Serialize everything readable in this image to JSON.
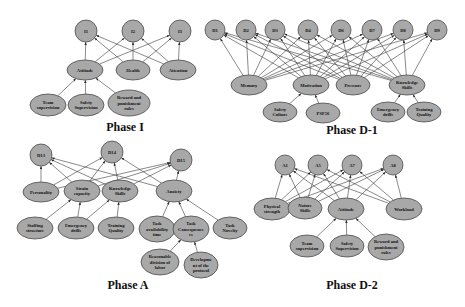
{
  "diagrams": [
    {
      "id": "phaseI",
      "title": "Phase I",
      "title_pos": [
        125,
        131
      ],
      "nodes": [
        {
          "id": "I1",
          "label": [
            "I1"
          ],
          "x": 86,
          "y": 31,
          "rx": 11,
          "ry": 11
        },
        {
          "id": "I2",
          "label": [
            "I2"
          ],
          "x": 133,
          "y": 31,
          "rx": 11,
          "ry": 11
        },
        {
          "id": "I3",
          "label": [
            "I3"
          ],
          "x": 180,
          "y": 31,
          "rx": 11,
          "ry": 11
        },
        {
          "id": "Attitude",
          "label": [
            "Attitude"
          ],
          "x": 85,
          "y": 70,
          "rx": 18,
          "ry": 10
        },
        {
          "id": "Health",
          "label": [
            "Health"
          ],
          "x": 133,
          "y": 70,
          "rx": 17,
          "ry": 10
        },
        {
          "id": "Attention",
          "label": [
            "Attention"
          ],
          "x": 178,
          "y": 70,
          "rx": 18,
          "ry": 10
        },
        {
          "id": "TeamSup",
          "label": [
            "Team",
            "supervision"
          ],
          "x": 48,
          "y": 105,
          "rx": 18,
          "ry": 11
        },
        {
          "id": "SafetySup",
          "label": [
            "Safety",
            "Supervision"
          ],
          "x": 86,
          "y": 105,
          "rx": 18,
          "ry": 11
        },
        {
          "id": "Reward",
          "label": [
            "Reward and",
            "punishment",
            "rules"
          ],
          "x": 129,
          "y": 103,
          "rx": 21,
          "ry": 13
        }
      ],
      "edges": [
        [
          "Attitude",
          "I1"
        ],
        [
          "Attitude",
          "I2"
        ],
        [
          "Attitude",
          "I3"
        ],
        [
          "Health",
          "I1"
        ],
        [
          "Health",
          "I2"
        ],
        [
          "Health",
          "I3"
        ],
        [
          "Attention",
          "I1"
        ],
        [
          "Attention",
          "I2"
        ],
        [
          "Attention",
          "I3"
        ],
        [
          "TeamSup",
          "Attitude"
        ],
        [
          "SafetySup",
          "Attitude"
        ],
        [
          "Reward",
          "Attitude"
        ]
      ]
    },
    {
      "id": "phaseD1",
      "title": "Phase D-1",
      "title_pos": [
        352,
        134
      ],
      "nodes": [
        {
          "id": "D1",
          "label": [
            "D1"
          ],
          "x": 215,
          "y": 30,
          "rx": 10,
          "ry": 10
        },
        {
          "id": "D2",
          "label": [
            "D2"
          ],
          "x": 246,
          "y": 30,
          "rx": 10,
          "ry": 10
        },
        {
          "id": "D3",
          "label": [
            "D3"
          ],
          "x": 275,
          "y": 30,
          "rx": 10,
          "ry": 10
        },
        {
          "id": "D4",
          "label": [
            "D4"
          ],
          "x": 308,
          "y": 30,
          "rx": 10,
          "ry": 10
        },
        {
          "id": "D6",
          "label": [
            "D6"
          ],
          "x": 341,
          "y": 30,
          "rx": 10,
          "ry": 10
        },
        {
          "id": "D7",
          "label": [
            "D7"
          ],
          "x": 372,
          "y": 30,
          "rx": 10,
          "ry": 10
        },
        {
          "id": "D8",
          "label": [
            "D8"
          ],
          "x": 403,
          "y": 30,
          "rx": 10,
          "ry": 10
        },
        {
          "id": "D9",
          "label": [
            "D9"
          ],
          "x": 437,
          "y": 30,
          "rx": 10,
          "ry": 10
        },
        {
          "id": "Memory",
          "label": [
            "Memory"
          ],
          "x": 249,
          "y": 85,
          "rx": 18,
          "ry": 10
        },
        {
          "id": "Motivation",
          "label": [
            "Motivation"
          ],
          "x": 311,
          "y": 85,
          "rx": 18,
          "ry": 10
        },
        {
          "id": "Pressure",
          "label": [
            "Pressure"
          ],
          "x": 353,
          "y": 85,
          "rx": 17,
          "ry": 10
        },
        {
          "id": "KnowSkills",
          "label": [
            "Knowledge",
            "Skills"
          ],
          "x": 407,
          "y": 85,
          "rx": 18,
          "ry": 10
        },
        {
          "id": "SafetyCulture",
          "label": [
            "Safety",
            "Culture"
          ],
          "x": 280,
          "y": 112,
          "rx": 17,
          "ry": 10
        },
        {
          "id": "PSF56",
          "label": [
            "PSF56"
          ],
          "x": 323,
          "y": 113,
          "rx": 17,
          "ry": 10
        },
        {
          "id": "EmDrills",
          "label": [
            "Emergency",
            "drills"
          ],
          "x": 388,
          "y": 112,
          "rx": 17,
          "ry": 10
        },
        {
          "id": "TrainQ",
          "label": [
            "Training",
            "Quality"
          ],
          "x": 424,
          "y": 112,
          "rx": 17,
          "ry": 10
        }
      ],
      "edges": [
        [
          "Memory",
          "D1"
        ],
        [
          "Memory",
          "D2"
        ],
        [
          "Memory",
          "D3"
        ],
        [
          "Memory",
          "D4"
        ],
        [
          "Memory",
          "D6"
        ],
        [
          "Memory",
          "D7"
        ],
        [
          "Memory",
          "D8"
        ],
        [
          "Memory",
          "D9"
        ],
        [
          "Motivation",
          "D1"
        ],
        [
          "Motivation",
          "D2"
        ],
        [
          "Motivation",
          "D3"
        ],
        [
          "Motivation",
          "D4"
        ],
        [
          "Motivation",
          "D6"
        ],
        [
          "Motivation",
          "D7"
        ],
        [
          "Motivation",
          "D8"
        ],
        [
          "Motivation",
          "D9"
        ],
        [
          "Pressure",
          "D1"
        ],
        [
          "Pressure",
          "D2"
        ],
        [
          "Pressure",
          "D3"
        ],
        [
          "Pressure",
          "D4"
        ],
        [
          "Pressure",
          "D6"
        ],
        [
          "Pressure",
          "D7"
        ],
        [
          "Pressure",
          "D8"
        ],
        [
          "Pressure",
          "D9"
        ],
        [
          "KnowSkills",
          "D1"
        ],
        [
          "KnowSkills",
          "D2"
        ],
        [
          "KnowSkills",
          "D3"
        ],
        [
          "KnowSkills",
          "D4"
        ],
        [
          "KnowSkills",
          "D6"
        ],
        [
          "KnowSkills",
          "D7"
        ],
        [
          "KnowSkills",
          "D8"
        ],
        [
          "KnowSkills",
          "D9"
        ],
        [
          "SafetyCulture",
          "Motivation"
        ],
        [
          "PSF56",
          "Motivation"
        ],
        [
          "EmDrills",
          "KnowSkills"
        ],
        [
          "TrainQ",
          "KnowSkills"
        ]
      ]
    },
    {
      "id": "phaseA",
      "title": "Phase A",
      "title_pos": [
        128,
        289
      ],
      "nodes": [
        {
          "id": "D13",
          "label": [
            "D13"
          ],
          "x": 41,
          "y": 155,
          "rx": 11,
          "ry": 11
        },
        {
          "id": "D14",
          "label": [
            "D14"
          ],
          "x": 112,
          "y": 152,
          "rx": 11,
          "ry": 11
        },
        {
          "id": "D15",
          "label": [
            "D15"
          ],
          "x": 181,
          "y": 160,
          "rx": 11,
          "ry": 11
        },
        {
          "id": "Personality",
          "label": [
            "Personality"
          ],
          "x": 41,
          "y": 192,
          "rx": 18,
          "ry": 10
        },
        {
          "id": "Strain",
          "label": [
            "Strain",
            "capacity"
          ],
          "x": 82,
          "y": 191,
          "rx": 18,
          "ry": 11
        },
        {
          "id": "KnowSkillsA",
          "label": [
            "Knowledge",
            "Skills"
          ],
          "x": 120,
          "y": 191,
          "rx": 18,
          "ry": 11
        },
        {
          "id": "Anxiety",
          "label": [
            "Anxiety"
          ],
          "x": 174,
          "y": 191,
          "rx": 18,
          "ry": 11
        },
        {
          "id": "Staffing",
          "label": [
            "Staffing",
            "structure"
          ],
          "x": 35,
          "y": 228,
          "rx": 18,
          "ry": 11
        },
        {
          "id": "EmDrillsA",
          "label": [
            "Emergency",
            "drills"
          ],
          "x": 76,
          "y": 228,
          "rx": 18,
          "ry": 11
        },
        {
          "id": "TrainQA",
          "label": [
            "Training",
            "Quality"
          ],
          "x": 116,
          "y": 228,
          "rx": 18,
          "ry": 11
        },
        {
          "id": "TaskAvail",
          "label": [
            "Task",
            "availability",
            "time"
          ],
          "x": 157,
          "y": 229,
          "rx": 18,
          "ry": 13
        },
        {
          "id": "TaskCons",
          "label": [
            "Task",
            "Consequence",
            "es"
          ],
          "x": 191,
          "y": 229,
          "rx": 18,
          "ry": 13
        },
        {
          "id": "TaskNovelty",
          "label": [
            "Task",
            "Novelty"
          ],
          "x": 230,
          "y": 228,
          "rx": 17,
          "ry": 11
        },
        {
          "id": "Reasonable",
          "label": [
            "Reasonable",
            "division of",
            "labor"
          ],
          "x": 160,
          "y": 262,
          "rx": 19,
          "ry": 13
        },
        {
          "id": "Develop",
          "label": [
            "Developme",
            "nt of the",
            "protocol"
          ],
          "x": 201,
          "y": 265,
          "rx": 17,
          "ry": 13
        }
      ],
      "edges": [
        [
          "Personality",
          "D13"
        ],
        [
          "Personality",
          "D14"
        ],
        [
          "Personality",
          "D15"
        ],
        [
          "Strain",
          "D13"
        ],
        [
          "Strain",
          "D14"
        ],
        [
          "Strain",
          "D15"
        ],
        [
          "KnowSkillsA",
          "D13"
        ],
        [
          "KnowSkillsA",
          "D14"
        ],
        [
          "KnowSkillsA",
          "D15"
        ],
        [
          "Anxiety",
          "D13"
        ],
        [
          "Anxiety",
          "D14"
        ],
        [
          "Anxiety",
          "D15"
        ],
        [
          "Staffing",
          "Strain"
        ],
        [
          "EmDrillsA",
          "Strain"
        ],
        [
          "EmDrillsA",
          "KnowSkillsA"
        ],
        [
          "TrainQA",
          "KnowSkillsA"
        ],
        [
          "TaskAvail",
          "Anxiety"
        ],
        [
          "TaskCons",
          "Anxiety"
        ],
        [
          "TaskNovelty",
          "Anxiety"
        ],
        [
          "Reasonable",
          "TaskCons"
        ],
        [
          "Develop",
          "TaskCons"
        ]
      ]
    },
    {
      "id": "phaseD2",
      "title": "Phase D-2",
      "title_pos": [
        352,
        289
      ],
      "nodes": [
        {
          "id": "A1",
          "label": [
            "A1"
          ],
          "x": 285,
          "y": 165,
          "rx": 10,
          "ry": 10
        },
        {
          "id": "A5",
          "label": [
            "A5"
          ],
          "x": 318,
          "y": 165,
          "rx": 10,
          "ry": 10
        },
        {
          "id": "A7",
          "label": [
            "A7"
          ],
          "x": 352,
          "y": 165,
          "rx": 10,
          "ry": 10
        },
        {
          "id": "A8",
          "label": [
            "A8"
          ],
          "x": 393,
          "y": 165,
          "rx": 10,
          "ry": 10
        },
        {
          "id": "Physical",
          "label": [
            "Physical",
            "strength"
          ],
          "x": 272,
          "y": 209,
          "rx": 18,
          "ry": 11
        },
        {
          "id": "Nature",
          "label": [
            "Nature",
            "Skills"
          ],
          "x": 305,
          "y": 208,
          "rx": 17,
          "ry": 11
        },
        {
          "id": "AttitudeD2",
          "label": [
            "Attitude"
          ],
          "x": 346,
          "y": 209,
          "rx": 18,
          "ry": 11
        },
        {
          "id": "Workload",
          "label": [
            "Workload"
          ],
          "x": 404,
          "y": 209,
          "rx": 18,
          "ry": 11
        },
        {
          "id": "TeamSupD2",
          "label": [
            "Team",
            "supervision"
          ],
          "x": 307,
          "y": 246,
          "rx": 17,
          "ry": 11
        },
        {
          "id": "SafetySupD2",
          "label": [
            "Safety",
            "Supervision"
          ],
          "x": 347,
          "y": 246,
          "rx": 17,
          "ry": 11
        },
        {
          "id": "RewardD2",
          "label": [
            "Reward and",
            "punishment",
            "rules"
          ],
          "x": 386,
          "y": 247,
          "rx": 18,
          "ry": 13
        }
      ],
      "edges": [
        [
          "Physical",
          "A1"
        ],
        [
          "Physical",
          "A5"
        ],
        [
          "Physical",
          "A7"
        ],
        [
          "Physical",
          "A8"
        ],
        [
          "Nature",
          "A1"
        ],
        [
          "Nature",
          "A5"
        ],
        [
          "Nature",
          "A7"
        ],
        [
          "Nature",
          "A8"
        ],
        [
          "AttitudeD2",
          "A1"
        ],
        [
          "AttitudeD2",
          "A5"
        ],
        [
          "AttitudeD2",
          "A7"
        ],
        [
          "AttitudeD2",
          "A8"
        ],
        [
          "Workload",
          "A1"
        ],
        [
          "Workload",
          "A5"
        ],
        [
          "Workload",
          "A7"
        ],
        [
          "Workload",
          "A8"
        ],
        [
          "TeamSupD2",
          "AttitudeD2"
        ],
        [
          "SafetySupD2",
          "AttitudeD2"
        ],
        [
          "RewardD2",
          "AttitudeD2"
        ]
      ]
    }
  ],
  "colors": {
    "node_fill": "#a8a8a8",
    "node_stroke": "#4a4a4a",
    "edge": "#3a3a3a",
    "text": "#111111",
    "background": "#ffffff"
  }
}
